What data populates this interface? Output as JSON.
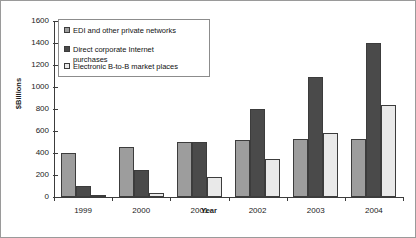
{
  "chart_data": {
    "type": "bar",
    "title": "",
    "subtitle": "",
    "xlabel": "Year",
    "ylabel": "$Billions",
    "categories": [
      "1999",
      "2000",
      "2001",
      "2002",
      "2003",
      "2004"
    ],
    "series": [
      {
        "name": "EDI and other private networks",
        "color": "#9d9d9d",
        "values": [
          400,
          455,
          500,
          520,
          530,
          530
        ]
      },
      {
        "name": "Direct corporate Internet purchases",
        "color": "#4a4a4a",
        "values": [
          100,
          250,
          500,
          800,
          1090,
          1400
        ]
      },
      {
        "name": "Electronic B-to-B market places",
        "color": "#e9e9e9",
        "values": [
          20,
          40,
          180,
          350,
          580,
          840
        ]
      }
    ],
    "ylim": [
      0,
      1600
    ],
    "ytick_values": [
      0,
      200,
      400,
      600,
      800,
      1000,
      1200,
      1400,
      1600
    ],
    "ytick_labels": [
      "0",
      "200",
      "400",
      "600",
      "800",
      "1000",
      "1200",
      "1400",
      "1600"
    ],
    "grid": false,
    "legend_position": "upper-left-inside",
    "legend_entries": [
      "EDI and other private networks",
      "Direct corporate Internet\npurchases",
      "Electronic B-to-B market places"
    ]
  }
}
